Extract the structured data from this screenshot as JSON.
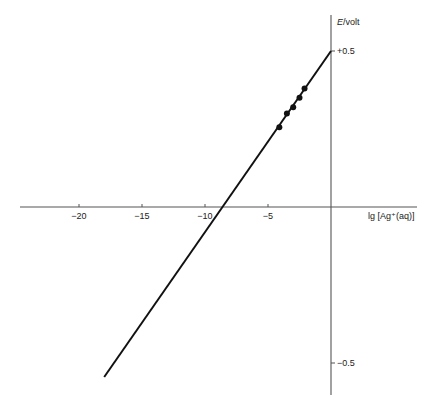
{
  "chart_data": {
    "type": "line",
    "title": "",
    "xlabel": "lg [Ag+(aq)]",
    "ylabel": "E/volt",
    "xlim": [
      -22,
      7
    ],
    "ylim": [
      -0.62,
      0.62
    ],
    "x_ticks": [
      -20,
      -15,
      -10,
      -5
    ],
    "x_tick_labels": [
      "−20",
      "−15",
      "−10",
      "−5"
    ],
    "y_ticks": [
      0.5,
      -0.5
    ],
    "y_tick_labels": [
      "+0.5",
      "−0.5"
    ],
    "grid": false,
    "legend": null,
    "series": [
      {
        "name": "fitted line",
        "kind": "line",
        "x": [
          -18.0,
          0.0
        ],
        "y": [
          -0.545,
          0.5
        ]
      },
      {
        "name": "measured points",
        "kind": "scatter",
        "x": [
          -4.1,
          -3.5,
          -3.0,
          -2.5,
          -2.1
        ],
        "y": [
          0.256,
          0.3,
          0.32,
          0.35,
          0.38
        ]
      }
    ],
    "annotations": {
      "x_intercept": -8.6,
      "slope_volt_per_decade": 0.058
    }
  },
  "axes": {
    "y_label_main": "E",
    "y_label_unit": "/volt",
    "x_label": "lg [Ag⁺(aq)]"
  },
  "colors": {
    "line": "#111111",
    "axis": "#555555",
    "background": "#ffffff"
  }
}
